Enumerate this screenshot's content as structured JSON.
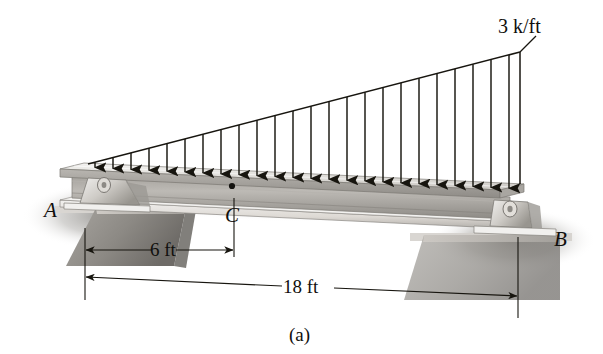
{
  "figure": {
    "caption": "(a)",
    "type": "engineering-free-body-diagram"
  },
  "labels": {
    "support_a": "A",
    "support_b": "B",
    "point_c": "C",
    "load_intensity": "3 k/ft"
  },
  "dimensions": [
    {
      "id": "dim-ac",
      "text": "6 ft",
      "from": "A",
      "to": "C",
      "value": 6,
      "unit": "ft"
    },
    {
      "id": "dim-ab",
      "text": "18 ft",
      "from": "A",
      "to": "B",
      "value": 18,
      "unit": "ft"
    }
  ],
  "load": {
    "shape": "triangular",
    "start_intensity": 0,
    "end_intensity": 3,
    "unit": "k/ft",
    "peak_label": "3 k/ft",
    "peak_at": "B",
    "arrow_count": 24,
    "direction": "downward"
  },
  "colors": {
    "ink": "#100f0d",
    "beam_light": "#e8e6e2",
    "beam_mid": "#c8c5c0",
    "beam_dark": "#9d9a95",
    "shadow": "#8f8d89",
    "background": "#ffffff"
  },
  "geometry": {
    "support_a_x": 85,
    "point_c_x": 234,
    "support_b_x": 518,
    "load_apex_y": 52,
    "beam_top_left_y": 160,
    "beam_top_right_y": 184
  }
}
